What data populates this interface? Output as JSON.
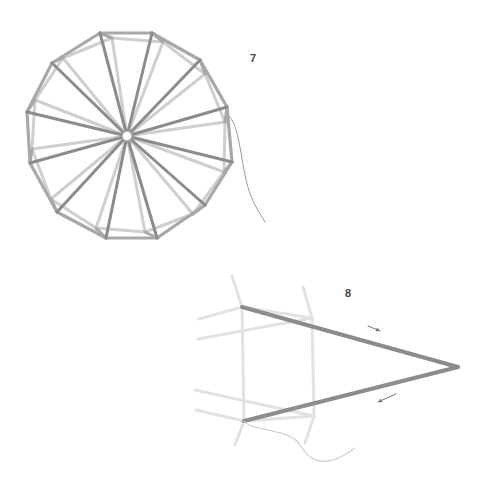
{
  "figures": [
    {
      "step": "7",
      "description": "Top-down view of a 12-sided polyhedral wheel of straws with spokes meeting at a central hub; a thread trails from the right edge.",
      "hub": {
        "x": 127,
        "y": 136
      },
      "outer_vertices": [
        [
          100,
          33
        ],
        [
          152,
          33
        ],
        [
          200,
          60
        ],
        [
          227,
          107
        ],
        [
          232,
          162
        ],
        [
          205,
          205
        ],
        [
          157,
          238
        ],
        [
          106,
          238
        ],
        [
          57,
          212
        ],
        [
          30,
          163
        ],
        [
          27,
          112
        ],
        [
          52,
          63
        ]
      ],
      "inner_vertices": [
        [
          112,
          38
        ],
        [
          163,
          42
        ],
        [
          205,
          74
        ],
        [
          225,
          122
        ],
        [
          224,
          172
        ],
        [
          193,
          214
        ],
        [
          145,
          232
        ],
        [
          96,
          228
        ],
        [
          51,
          199
        ],
        [
          32,
          149
        ],
        [
          35,
          100
        ],
        [
          63,
          58
        ]
      ],
      "thread_path": "M229 116 C 238 125, 240 150, 245 175 S 258 210, 265 222"
    },
    {
      "step": "8",
      "description": "Side detail: two straws joined into a long V-shaped point with direction arrows showing threading path.",
      "tip": {
        "x": 458,
        "y": 367
      },
      "top_joint": {
        "x": 242,
        "y": 307
      },
      "bottom_joint": {
        "x": 244,
        "y": 421
      },
      "arrows": [
        {
          "direction": "out",
          "x1": 368,
          "y1": 326,
          "x2": 380,
          "y2": 331
        },
        {
          "direction": "back",
          "x1": 396,
          "y1": 394,
          "x2": 378,
          "y2": 402
        }
      ],
      "thread_path": "M244 421 C 252 432, 290 428, 300 445 S 325 470, 355 448"
    }
  ],
  "colors": {
    "dark_straw": "#8c8c8c",
    "mid_straw": "#a8a8a8",
    "light_straw": "#cfcfcf",
    "faint_straw": "#e2e2e2",
    "thread": "#9a9a9a",
    "label": "#444444"
  }
}
